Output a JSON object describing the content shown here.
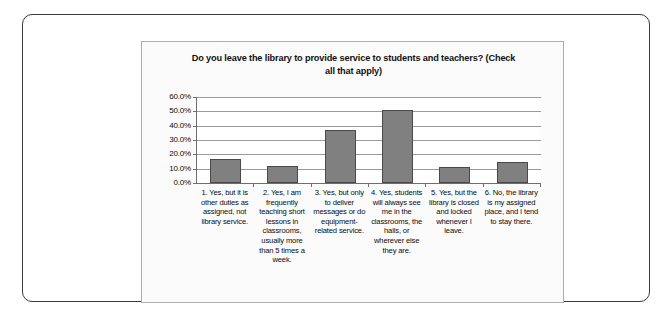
{
  "chart_data": {
    "type": "bar",
    "title": "Do you leave the library to provide service to students and teachers? (Check all that apply)",
    "title_line1": "Do you leave the library to provide service to students and teachers? (Check",
    "title_line2": "all that apply)",
    "xlabel": "",
    "ylabel": "",
    "ylim": [
      0,
      60
    ],
    "grid": true,
    "legend": "none",
    "y_ticks": [
      "0.0%",
      "10.0%",
      "20.0%",
      "30.0%",
      "40.0%",
      "50.0%",
      "60.0%"
    ],
    "y_tick_values": [
      0,
      10,
      20,
      30,
      40,
      50,
      60
    ],
    "categories": [
      "1. Yes, but it is other duties as assigned, not library service.",
      "2. Yes, I am frequently teaching short lessons in classrooms, usually more than 5 times a week.",
      "3. Yes, but only to deliver messages or do equipment-related service.",
      "4. Yes, students will always see me in the classrooms, the halls, or wherever else they are.",
      "5. Yes, but the library is closed and locked whenever I leave.",
      "6. No, the library is my assigned place, and I tend to stay there."
    ],
    "values": [
      17,
      12,
      37,
      51,
      11,
      15
    ],
    "bar_color": "#808080",
    "bar_border_color": "#4a4a4a",
    "gridline_color": "#9a9a9a",
    "axis_color": "#6e6e6e",
    "plot_background": "#ffffff",
    "chart_background": "#fbfbfb",
    "frame_color": "#adadad",
    "outer_frame_color": "#3a3a3a"
  }
}
